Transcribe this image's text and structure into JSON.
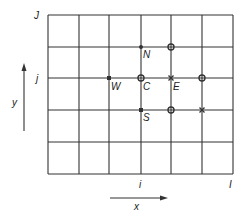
{
  "diagram": {
    "colors": {
      "line": "#333333",
      "text": "#222222",
      "background": "#ffffff"
    },
    "grid": {
      "columns": 6,
      "rows": 5,
      "x_lines": [
        48,
        79,
        109,
        141,
        171,
        202,
        233
      ],
      "y_lines": [
        15,
        47,
        78,
        110,
        142,
        174
      ]
    },
    "labels": {
      "top_row_index": "J",
      "row_index": "j",
      "col_index": "i",
      "last_col_index": "I",
      "y_axis": "y",
      "x_axis": "x"
    },
    "nodes": {
      "north": "N",
      "west": "W",
      "center": "C",
      "east": "E",
      "south": "S"
    },
    "markers": [
      {
        "name": "N",
        "type": "filled-dot",
        "x": 141,
        "y": 47
      },
      {
        "name": "NE",
        "type": "circle",
        "x": 171,
        "y": 47
      },
      {
        "name": "W",
        "type": "filled-square",
        "x": 109,
        "y": 78
      },
      {
        "name": "C",
        "type": "circle",
        "x": 141,
        "y": 78
      },
      {
        "name": "E",
        "type": "cross",
        "x": 171,
        "y": 78
      },
      {
        "name": "EE",
        "type": "circle",
        "x": 202,
        "y": 78
      },
      {
        "name": "S",
        "type": "filled-square",
        "x": 141,
        "y": 110
      },
      {
        "name": "SE",
        "type": "circle",
        "x": 171,
        "y": 110
      },
      {
        "name": "SEE",
        "type": "cross",
        "x": 202,
        "y": 110
      }
    ]
  }
}
